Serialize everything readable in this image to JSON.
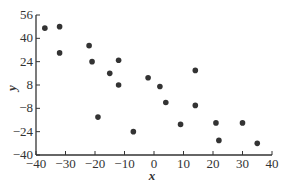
{
  "chart_data": {
    "type": "scatter",
    "title": "",
    "xlabel": "x",
    "ylabel": "y",
    "xlim": [
      -40,
      40
    ],
    "ylim": [
      -40,
      56
    ],
    "xticks": [
      -40,
      -30,
      -20,
      -10,
      0,
      10,
      20,
      30,
      40
    ],
    "yticks": [
      -40,
      -24,
      -8,
      8,
      24,
      40,
      56
    ],
    "xtick_labels": [
      "−40",
      "−30",
      "−20",
      "−10",
      "0",
      "10",
      "20",
      "30",
      "40"
    ],
    "ytick_labels": [
      "−40",
      "−24",
      "−8",
      "8",
      "24",
      "40",
      "56"
    ],
    "grid": false,
    "legend": null,
    "marker_color": "#333333",
    "points": [
      {
        "x": -37,
        "y": 47
      },
      {
        "x": -32,
        "y": 48
      },
      {
        "x": -32,
        "y": 30
      },
      {
        "x": -22,
        "y": 35
      },
      {
        "x": -21,
        "y": 24
      },
      {
        "x": -19,
        "y": -14
      },
      {
        "x": -15,
        "y": 16
      },
      {
        "x": -12,
        "y": 25
      },
      {
        "x": -12,
        "y": 8
      },
      {
        "x": -7,
        "y": -24
      },
      {
        "x": -2,
        "y": 13
      },
      {
        "x": 2,
        "y": 7
      },
      {
        "x": 4,
        "y": -4
      },
      {
        "x": 9,
        "y": -19
      },
      {
        "x": 14,
        "y": 18
      },
      {
        "x": 14,
        "y": -6
      },
      {
        "x": 21,
        "y": -18
      },
      {
        "x": 22,
        "y": -30
      },
      {
        "x": 30,
        "y": -18
      },
      {
        "x": 35,
        "y": -32
      }
    ]
  }
}
